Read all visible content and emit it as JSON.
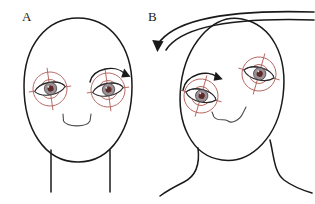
{
  "figure": {
    "type": "diagram",
    "background_color": "#ffffff",
    "line_color": "#1a1a1a",
    "reticle_color": "#b3645c",
    "iris_color": "#9a9196",
    "pupil_color": "#5d2b27"
  },
  "panels": [
    {
      "id": "A",
      "label": "A",
      "label_x": 22,
      "label_y": 20,
      "description": "upright frontal head with both eyes marked by crosshair reticles",
      "head": {
        "name": "head-outline-a",
        "center_x": 78,
        "center_y": 90,
        "rx": 54,
        "ry": 72,
        "rotation_deg": 0
      },
      "neck": {
        "name": "neck-a",
        "left_x": 51,
        "right_x": 110,
        "top_y": 148,
        "bottom_y": 192
      },
      "nose": {
        "name": "nose-a",
        "x": 78,
        "y": 122
      },
      "eyes": [
        {
          "side": "left",
          "name": "eye-left-a",
          "cx": 50,
          "cy": 88,
          "reticle_radius": 17,
          "rotation_deg": -8,
          "arrow": null
        },
        {
          "side": "right",
          "name": "eye-right-a",
          "cx": 108,
          "cy": 90,
          "reticle_radius": 17,
          "rotation_deg": -8,
          "arrow": {
            "name": "torsion-arrow-right-eye-a",
            "direction": "clockwise",
            "label": "ocular torsion clockwise"
          }
        }
      ],
      "tilt_arrow": null
    },
    {
      "id": "B",
      "label": "B",
      "label_x": 148,
      "label_y": 20,
      "description": "head tilted to the subject's right with counter-rolled eyes and a large tilt arrow",
      "head": {
        "name": "head-outline-b",
        "center_x": 234,
        "center_y": 88,
        "rx": 52,
        "ry": 71,
        "rotation_deg": 18
      },
      "neck": {
        "name": "neck-b",
        "left_x": 192,
        "right_x": 268,
        "top_y": 148,
        "bottom_y": 196
      },
      "nose": {
        "name": "nose-b",
        "x": 228,
        "y": 118
      },
      "eyes": [
        {
          "side": "left",
          "name": "eye-left-b",
          "cx": 200,
          "cy": 95,
          "reticle_radius": 17,
          "rotation_deg": 16,
          "arrow": {
            "name": "torsion-arrow-left-eye-b",
            "direction": "clockwise",
            "label": "ocular counter-roll"
          }
        },
        {
          "side": "right",
          "name": "eye-right-b",
          "cx": 258,
          "cy": 74,
          "reticle_radius": 17,
          "rotation_deg": 16,
          "arrow": null
        }
      ],
      "tilt_arrow": {
        "name": "head-tilt-arrow-b",
        "direction": "counter-clockwise-down-left",
        "label": "head tilt direction",
        "start_x": 300,
        "start_y": 14,
        "end_x": 152,
        "end_y": 48
      }
    }
  ]
}
